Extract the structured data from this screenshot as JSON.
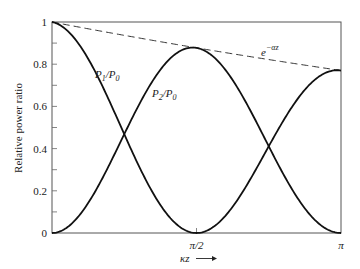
{
  "chart_data": {
    "type": "line",
    "title": "",
    "xlabel": "κz",
    "ylabel": "Relative power ratio",
    "xlim": [
      0,
      3.14159
    ],
    "ylim": [
      0,
      1
    ],
    "grid": false,
    "legend": "inline labels",
    "x_ticks": [
      {
        "value": 1.5708,
        "label": "π/2"
      },
      {
        "value": 3.14159,
        "label": "π"
      }
    ],
    "y_ticks": [
      {
        "value": 0,
        "label": "0"
      },
      {
        "value": 0.2,
        "label": "0.2"
      },
      {
        "value": 0.4,
        "label": "0.4"
      },
      {
        "value": 0.6,
        "label": "0.6"
      },
      {
        "value": 0.8,
        "label": "0.8"
      },
      {
        "value": 1,
        "label": "1"
      }
    ],
    "decay_end_value": 0.77,
    "series": [
      {
        "name": "P1/P0",
        "label_main": "P",
        "label_sub1": "1",
        "label_sep": "/P",
        "label_sub2": "0",
        "style": "solid",
        "function": "cos^2(κz)·e^{-αz}",
        "x": [
          0,
          0.3927,
          0.7854,
          1.1781,
          1.5708,
          1.9635,
          2.3562,
          2.7489,
          3.14159
        ],
        "values": [
          1.0,
          0.83,
          0.47,
          0.13,
          0.0,
          0.12,
          0.41,
          0.7,
          0.77
        ]
      },
      {
        "name": "P2/P0",
        "label_main": "P",
        "label_sub1": "2",
        "label_sep": "/P",
        "label_sub2": "0",
        "style": "solid",
        "function": "sin^2(κz)·e^{-αz}",
        "x": [
          0,
          0.3927,
          0.7854,
          1.1781,
          1.5708,
          1.9635,
          2.3562,
          2.7489,
          3.14159
        ],
        "values": [
          0.0,
          0.14,
          0.47,
          0.78,
          0.88,
          0.7,
          0.41,
          0.12,
          0.0
        ]
      },
      {
        "name": "e^-αz",
        "label_main": "e",
        "label_sup": "−αz",
        "style": "dashed",
        "function": "e^{-αz}",
        "x": [
          0,
          1.5708,
          3.14159
        ],
        "values": [
          1.0,
          0.88,
          0.77
        ]
      }
    ]
  }
}
